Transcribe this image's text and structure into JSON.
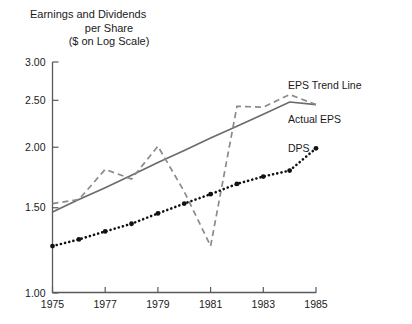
{
  "chart_data": {
    "type": "line",
    "title": "Earnings and Dividends per Share ($ on Log Scale)",
    "title_lines": [
      "Earnings and Dividends",
      "per Share",
      "($ on Log Scale)"
    ],
    "xlabel": "",
    "ylabel": "",
    "scale": "log",
    "grid": false,
    "legend_position": "right-inline",
    "ylim": [
      1.0,
      3.0
    ],
    "ytick_labels": [
      "3.00",
      "2.50",
      "2.00",
      "1.50",
      "1.00"
    ],
    "ytick_values": [
      3.0,
      2.5,
      2.0,
      1.5,
      1.0
    ],
    "xlim": [
      1975,
      1985
    ],
    "xtick_labels": [
      "1975",
      "1977",
      "1979",
      "1981",
      "1983",
      "1985"
    ],
    "xtick_values": [
      1975,
      1977,
      1979,
      1981,
      1983,
      1985
    ],
    "x": [
      1975,
      1976,
      1977,
      1978,
      1979,
      1980,
      1981,
      1982,
      1983,
      1984,
      1985
    ],
    "series": [
      {
        "name": "EPS Trend Line",
        "style": "solid",
        "color": "#6b6b6b",
        "values": [
          1.47,
          1.56,
          1.65,
          1.75,
          1.86,
          1.97,
          2.09,
          2.21,
          2.34,
          2.48,
          2.45
        ]
      },
      {
        "name": "Actual EPS",
        "style": "dashed",
        "color": "#8a8a8a",
        "values": [
          1.53,
          1.56,
          1.8,
          1.72,
          2.01,
          1.62,
          1.25,
          2.43,
          2.42,
          2.57,
          2.45
        ]
      },
      {
        "name": "DPS",
        "style": "dotted",
        "color": "#111111",
        "values": [
          1.25,
          1.29,
          1.34,
          1.39,
          1.46,
          1.53,
          1.6,
          1.68,
          1.74,
          1.79,
          1.99
        ]
      }
    ],
    "annotations": [
      {
        "text": "EPS Trend Line",
        "x": 1985.3,
        "y": 2.55
      },
      {
        "text": "Actual EPS",
        "x": 1985.3,
        "y": 2.26
      },
      {
        "text": "DPS",
        "x": 1985.5,
        "y": 1.99
      }
    ]
  },
  "colors": {
    "background": "#ffffff",
    "axis": "#5a5a5a",
    "text": "#1a1a1a",
    "trend": "#6b6b6b",
    "actual": "#8a8a8a",
    "dps": "#111111"
  }
}
